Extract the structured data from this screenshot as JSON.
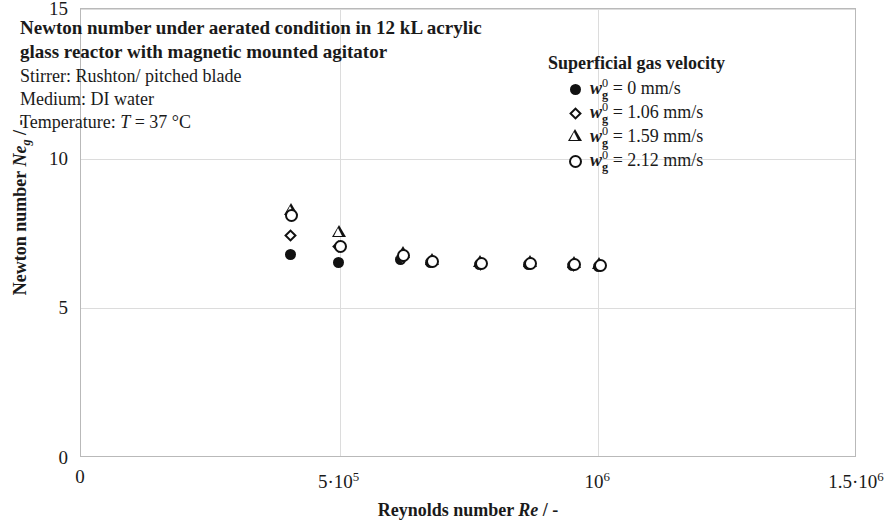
{
  "annotation": {
    "title": "Newton number under aerated condition in 12 kL acrylic glass reactor with magnetic mounted agitator",
    "lines": [
      "Stirrer: Rushton/ pitched blade",
      "Medium: DI water"
    ],
    "temperature_line_prefix": "Temperature: ",
    "temperature_line_symbol": "T",
    "temperature_line_value": " = 37 °C"
  },
  "legend": {
    "title": "Superficial gas velocity",
    "entries": [
      {
        "marker": "filled-circle",
        "symbol": "w",
        "superscript": "0",
        "subscript": "g",
        "value": " = 0 mm/s"
      },
      {
        "marker": "diamond",
        "symbol": "w",
        "superscript": "0",
        "subscript": "g",
        "value": " = 1.06  mm/s"
      },
      {
        "marker": "triangle",
        "symbol": "w",
        "superscript": "0",
        "subscript": "g",
        "value": " = 1.59  mm/s"
      },
      {
        "marker": "open-circle",
        "symbol": "w",
        "superscript": "0",
        "subscript": "g",
        "value": " = 2.12  mm/s"
      }
    ]
  },
  "chart_data": {
    "type": "scatter",
    "title": "Newton number under aerated condition in 12 kL acrylic glass reactor with magnetic mounted agitator",
    "xlabel": "Reynolds number Re / -",
    "ylabel": "Newton number Neg / -",
    "xlim": [
      0,
      1500000
    ],
    "ylim": [
      0,
      15
    ],
    "xticks": [
      0,
      500000,
      1000000,
      1500000
    ],
    "xticklabels": [
      "0",
      "5·10⁵",
      "10⁶",
      "1.5·10⁶"
    ],
    "yticks": [
      0,
      5,
      10,
      15
    ],
    "yticklabels": [
      "0",
      "5",
      "10",
      "15"
    ],
    "grid": true,
    "legend_position": "top-right",
    "series": [
      {
        "name": "w_g0 = 0 mm/s",
        "marker": "filled-circle",
        "x": [
          405000,
          498000,
          617000,
          675000,
          770000,
          865000,
          950000,
          1000000
        ],
        "y": [
          6.8,
          6.52,
          6.62,
          6.52,
          6.45,
          6.48,
          6.42,
          6.4
        ]
      },
      {
        "name": "w_g0 = 1.06 mm/s",
        "marker": "diamond",
        "x": [
          405000,
          498000,
          622000,
          678000,
          772000,
          867000,
          952000,
          1002000
        ],
        "y": [
          7.42,
          7.06,
          6.72,
          6.55,
          6.48,
          6.5,
          6.44,
          6.42
        ]
      },
      {
        "name": "w_g0 = 1.59 mm/s",
        "marker": "triangle",
        "x": [
          405000,
          498000,
          622000,
          678000,
          772000,
          867000,
          952000,
          1002000
        ],
        "y": [
          8.25,
          7.52,
          6.8,
          6.58,
          6.5,
          6.52,
          6.48,
          6.45
        ]
      },
      {
        "name": "w_g0 = 2.12 mm/s",
        "marker": "open-circle",
        "x": [
          407000,
          502000,
          624000,
          680000,
          774000,
          869000,
          954000,
          1004000
        ],
        "y": [
          8.1,
          7.08,
          6.75,
          6.56,
          6.49,
          6.51,
          6.46,
          6.43
        ]
      }
    ]
  },
  "axes": {
    "y_title_prefix": "Newton number ",
    "y_title_symbol": "Ne",
    "y_title_sub": "g",
    "y_title_suffix": " / -",
    "x_title_prefix": "Reynolds number ",
    "x_title_symbol": "Re",
    "x_title_suffix": " / -"
  }
}
